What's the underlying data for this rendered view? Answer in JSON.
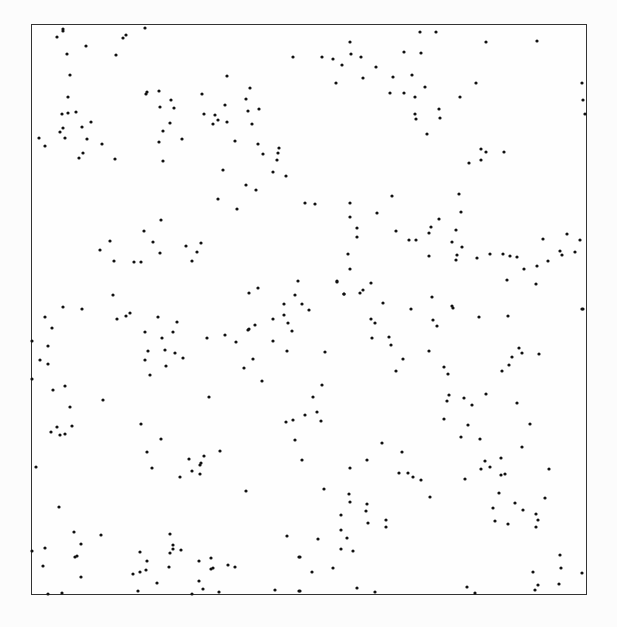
{
  "figure": {
    "frame": {
      "x0": 31,
      "y0": 24,
      "x1": 587,
      "y1": 595
    },
    "colors": {
      "border": "#333333",
      "point": "#111111",
      "background": "#fdfdfd"
    }
  },
  "chart_data": {
    "type": "scatter",
    "title": "",
    "xlabel": "",
    "ylabel": "",
    "grid": false,
    "legend": "none",
    "axes_ticks": "none",
    "coordinate_system": "pixel coordinates within 617x627 image; frame from (31,24) to (587,595)",
    "points": [
      [
        145,
        28
      ],
      [
        63,
        29
      ],
      [
        63,
        31
      ],
      [
        57,
        37
      ],
      [
        123,
        38
      ],
      [
        126,
        35
      ],
      [
        86,
        46
      ],
      [
        67,
        54
      ],
      [
        116,
        55
      ],
      [
        293,
        57
      ],
      [
        70,
        75
      ],
      [
        227,
        76
      ],
      [
        250,
        88
      ],
      [
        68,
        97
      ],
      [
        146,
        94
      ],
      [
        147,
        92
      ],
      [
        159,
        91
      ],
      [
        202,
        94
      ],
      [
        171,
        100
      ],
      [
        246,
        99
      ],
      [
        62,
        114
      ],
      [
        68,
        113
      ],
      [
        76,
        112
      ],
      [
        160,
        107
      ],
      [
        174,
        108
      ],
      [
        225,
        105
      ],
      [
        248,
        111
      ],
      [
        259,
        109
      ],
      [
        204,
        114
      ],
      [
        215,
        115
      ],
      [
        213,
        124
      ],
      [
        218,
        120
      ],
      [
        227,
        122
      ],
      [
        252,
        124
      ],
      [
        91,
        122
      ],
      [
        82,
        127
      ],
      [
        63,
        128
      ],
      [
        60,
        132
      ],
      [
        170,
        123
      ],
      [
        163,
        131
      ],
      [
        39,
        138
      ],
      [
        45,
        146
      ],
      [
        65,
        138
      ],
      [
        87,
        139
      ],
      [
        102,
        144
      ],
      [
        159,
        142
      ],
      [
        182,
        139
      ],
      [
        235,
        141
      ],
      [
        258,
        144
      ],
      [
        279,
        148
      ],
      [
        263,
        154
      ],
      [
        278,
        153
      ],
      [
        277,
        160
      ],
      [
        83,
        153
      ],
      [
        79,
        158
      ],
      [
        115,
        159
      ],
      [
        163,
        161
      ],
      [
        223,
        170
      ],
      [
        273,
        172
      ],
      [
        286,
        176
      ],
      [
        246,
        185
      ],
      [
        256,
        190
      ],
      [
        218,
        199
      ],
      [
        305,
        203
      ],
      [
        237,
        209
      ],
      [
        161,
        220
      ],
      [
        144,
        231
      ],
      [
        110,
        241
      ],
      [
        153,
        242
      ],
      [
        186,
        246
      ],
      [
        201,
        243
      ],
      [
        100,
        250
      ],
      [
        160,
        253
      ],
      [
        197,
        252
      ],
      [
        114,
        261
      ],
      [
        134,
        262
      ],
      [
        141,
        262
      ],
      [
        192,
        261
      ],
      [
        298,
        281
      ],
      [
        258,
        288
      ],
      [
        249,
        293
      ],
      [
        295,
        295
      ],
      [
        113,
        295
      ],
      [
        337,
        282
      ],
      [
        344,
        294
      ],
      [
        63,
        307
      ],
      [
        82,
        309
      ],
      [
        284,
        304
      ],
      [
        302,
        304
      ],
      [
        309,
        310
      ],
      [
        420,
        32
      ],
      [
        436,
        32
      ],
      [
        350,
        42
      ],
      [
        486,
        42
      ],
      [
        537,
        41
      ],
      [
        351,
        54
      ],
      [
        404,
        52
      ],
      [
        421,
        53
      ],
      [
        322,
        57
      ],
      [
        333,
        59
      ],
      [
        361,
        57
      ],
      [
        342,
        65
      ],
      [
        376,
        67
      ],
      [
        336,
        83
      ],
      [
        363,
        78
      ],
      [
        393,
        77
      ],
      [
        412,
        75
      ],
      [
        425,
        87
      ],
      [
        476,
        83
      ],
      [
        582,
        83
      ],
      [
        390,
        93
      ],
      [
        404,
        93
      ],
      [
        415,
        97
      ],
      [
        460,
        97
      ],
      [
        583,
        100
      ],
      [
        439,
        109
      ],
      [
        415,
        114
      ],
      [
        416,
        119
      ],
      [
        440,
        118
      ],
      [
        585,
        114
      ],
      [
        427,
        134
      ],
      [
        481,
        149
      ],
      [
        486,
        152
      ],
      [
        504,
        152
      ],
      [
        481,
        160
      ],
      [
        469,
        163
      ],
      [
        392,
        196
      ],
      [
        459,
        194
      ],
      [
        315,
        204
      ],
      [
        350,
        203
      ],
      [
        461,
        212
      ],
      [
        377,
        213
      ],
      [
        350,
        217
      ],
      [
        439,
        219
      ],
      [
        357,
        228
      ],
      [
        431,
        227
      ],
      [
        396,
        231
      ],
      [
        456,
        230
      ],
      [
        357,
        237
      ],
      [
        429,
        233
      ],
      [
        409,
        240
      ],
      [
        416,
        240
      ],
      [
        452,
        242
      ],
      [
        543,
        239
      ],
      [
        567,
        234
      ],
      [
        580,
        240
      ],
      [
        462,
        247
      ],
      [
        348,
        254
      ],
      [
        429,
        256
      ],
      [
        457,
        255
      ],
      [
        456,
        260
      ],
      [
        477,
        258
      ],
      [
        490,
        254
      ],
      [
        503,
        254
      ],
      [
        510,
        256
      ],
      [
        517,
        257
      ],
      [
        560,
        251
      ],
      [
        562,
        255
      ],
      [
        575,
        252
      ],
      [
        350,
        269
      ],
      [
        524,
        269
      ],
      [
        537,
        266
      ],
      [
        548,
        261
      ],
      [
        337,
        281
      ],
      [
        371,
        283
      ],
      [
        507,
        280
      ],
      [
        536,
        284
      ],
      [
        344,
        294
      ],
      [
        360,
        293
      ],
      [
        363,
        290
      ],
      [
        383,
        303
      ],
      [
        411,
        309
      ],
      [
        432,
        297
      ],
      [
        452,
        306
      ],
      [
        453,
        308
      ],
      [
        583,
        309
      ],
      [
        45,
        317
      ],
      [
        52,
        328
      ],
      [
        117,
        319
      ],
      [
        126,
        316
      ],
      [
        130,
        313
      ],
      [
        158,
        317
      ],
      [
        177,
        322
      ],
      [
        32,
        341
      ],
      [
        48,
        346
      ],
      [
        145,
        332
      ],
      [
        162,
        338
      ],
      [
        173,
        332
      ],
      [
        207,
        338
      ],
      [
        225,
        335
      ],
      [
        236,
        342
      ],
      [
        248,
        330
      ],
      [
        249,
        329
      ],
      [
        255,
        325
      ],
      [
        273,
        341
      ],
      [
        273,
        319
      ],
      [
        284,
        315
      ],
      [
        288,
        323
      ],
      [
        292,
        331
      ],
      [
        40,
        360
      ],
      [
        48,
        364
      ],
      [
        148,
        351
      ],
      [
        145,
        360
      ],
      [
        165,
        350
      ],
      [
        175,
        353
      ],
      [
        183,
        358
      ],
      [
        166,
        366
      ],
      [
        253,
        359
      ],
      [
        244,
        368
      ],
      [
        287,
        351
      ],
      [
        32,
        379
      ],
      [
        150,
        375
      ],
      [
        53,
        390
      ],
      [
        65,
        386
      ],
      [
        262,
        381
      ],
      [
        103,
        400
      ],
      [
        209,
        397
      ],
      [
        70,
        407
      ],
      [
        51,
        432
      ],
      [
        57,
        427
      ],
      [
        60,
        435
      ],
      [
        65,
        434
      ],
      [
        72,
        426
      ],
      [
        141,
        424
      ],
      [
        286,
        422
      ],
      [
        293,
        420
      ],
      [
        305,
        415
      ],
      [
        161,
        439
      ],
      [
        295,
        440
      ],
      [
        147,
        452
      ],
      [
        220,
        451
      ],
      [
        189,
        459
      ],
      [
        204,
        456
      ],
      [
        201,
        463
      ],
      [
        200,
        465
      ],
      [
        302,
        460
      ],
      [
        36,
        467
      ],
      [
        152,
        468
      ],
      [
        180,
        477
      ],
      [
        192,
        471
      ],
      [
        200,
        474
      ],
      [
        246,
        491
      ],
      [
        59,
        507
      ],
      [
        74,
        532
      ],
      [
        101,
        535
      ],
      [
        170,
        534
      ],
      [
        287,
        536
      ],
      [
        32,
        551
      ],
      [
        45,
        548
      ],
      [
        81,
        544
      ],
      [
        75,
        557
      ],
      [
        77,
        556
      ],
      [
        140,
        552
      ],
      [
        170,
        553
      ],
      [
        173,
        549
      ],
      [
        173,
        545
      ],
      [
        181,
        550
      ],
      [
        299,
        557
      ],
      [
        43,
        566
      ],
      [
        147,
        561
      ],
      [
        199,
        561
      ],
      [
        211,
        558
      ],
      [
        211,
        569
      ],
      [
        213,
        568
      ],
      [
        228,
        565
      ],
      [
        235,
        567
      ],
      [
        169,
        567
      ],
      [
        81,
        577
      ],
      [
        133,
        574
      ],
      [
        140,
        572
      ],
      [
        146,
        570
      ],
      [
        157,
        583
      ],
      [
        199,
        581
      ],
      [
        203,
        589
      ],
      [
        48,
        594
      ],
      [
        62,
        593
      ],
      [
        138,
        591
      ],
      [
        192,
        594
      ],
      [
        219,
        592
      ],
      [
        275,
        590
      ],
      [
        299,
        591
      ],
      [
        479,
        317
      ],
      [
        508,
        316
      ],
      [
        582,
        309
      ],
      [
        371,
        319
      ],
      [
        375,
        323
      ],
      [
        372,
        338
      ],
      [
        433,
        320
      ],
      [
        437,
        326
      ],
      [
        389,
        337
      ],
      [
        391,
        345
      ],
      [
        325,
        352
      ],
      [
        429,
        351
      ],
      [
        403,
        359
      ],
      [
        396,
        371
      ],
      [
        519,
        348
      ],
      [
        522,
        353
      ],
      [
        539,
        354
      ],
      [
        512,
        357
      ],
      [
        509,
        365
      ],
      [
        502,
        371
      ],
      [
        444,
        367
      ],
      [
        448,
        374
      ],
      [
        322,
        385
      ],
      [
        313,
        397
      ],
      [
        317,
        412
      ],
      [
        321,
        421
      ],
      [
        449,
        395
      ],
      [
        447,
        401
      ],
      [
        464,
        398
      ],
      [
        472,
        405
      ],
      [
        486,
        394
      ],
      [
        517,
        403
      ],
      [
        444,
        419
      ],
      [
        468,
        425
      ],
      [
        530,
        424
      ],
      [
        461,
        437
      ],
      [
        480,
        439
      ],
      [
        382,
        443
      ],
      [
        522,
        447
      ],
      [
        402,
        452
      ],
      [
        367,
        460
      ],
      [
        350,
        468
      ],
      [
        485,
        461
      ],
      [
        501,
        458
      ],
      [
        490,
        467
      ],
      [
        481,
        469
      ],
      [
        549,
        469
      ],
      [
        399,
        473
      ],
      [
        408,
        473
      ],
      [
        413,
        477
      ],
      [
        421,
        480
      ],
      [
        465,
        479
      ],
      [
        501,
        475
      ],
      [
        505,
        474
      ],
      [
        324,
        489
      ],
      [
        349,
        494
      ],
      [
        350,
        502
      ],
      [
        430,
        497
      ],
      [
        499,
        493
      ],
      [
        545,
        498
      ],
      [
        367,
        504
      ],
      [
        366,
        511
      ],
      [
        341,
        515
      ],
      [
        368,
        523
      ],
      [
        386,
        520
      ],
      [
        386,
        527
      ],
      [
        493,
        508
      ],
      [
        515,
        503
      ],
      [
        523,
        510
      ],
      [
        495,
        521
      ],
      [
        508,
        524
      ],
      [
        536,
        514
      ],
      [
        538,
        520
      ],
      [
        536,
        527
      ],
      [
        341,
        530
      ],
      [
        318,
        539
      ],
      [
        347,
        538
      ],
      [
        341,
        549
      ],
      [
        353,
        551
      ],
      [
        300,
        557
      ],
      [
        560,
        555
      ],
      [
        312,
        572
      ],
      [
        333,
        568
      ],
      [
        533,
        572
      ],
      [
        561,
        568
      ],
      [
        582,
        573
      ],
      [
        559,
        584
      ],
      [
        538,
        585
      ],
      [
        535,
        590
      ],
      [
        357,
        588
      ],
      [
        375,
        592
      ],
      [
        467,
        587
      ],
      [
        475,
        593
      ],
      [
        300,
        591
      ]
    ]
  }
}
